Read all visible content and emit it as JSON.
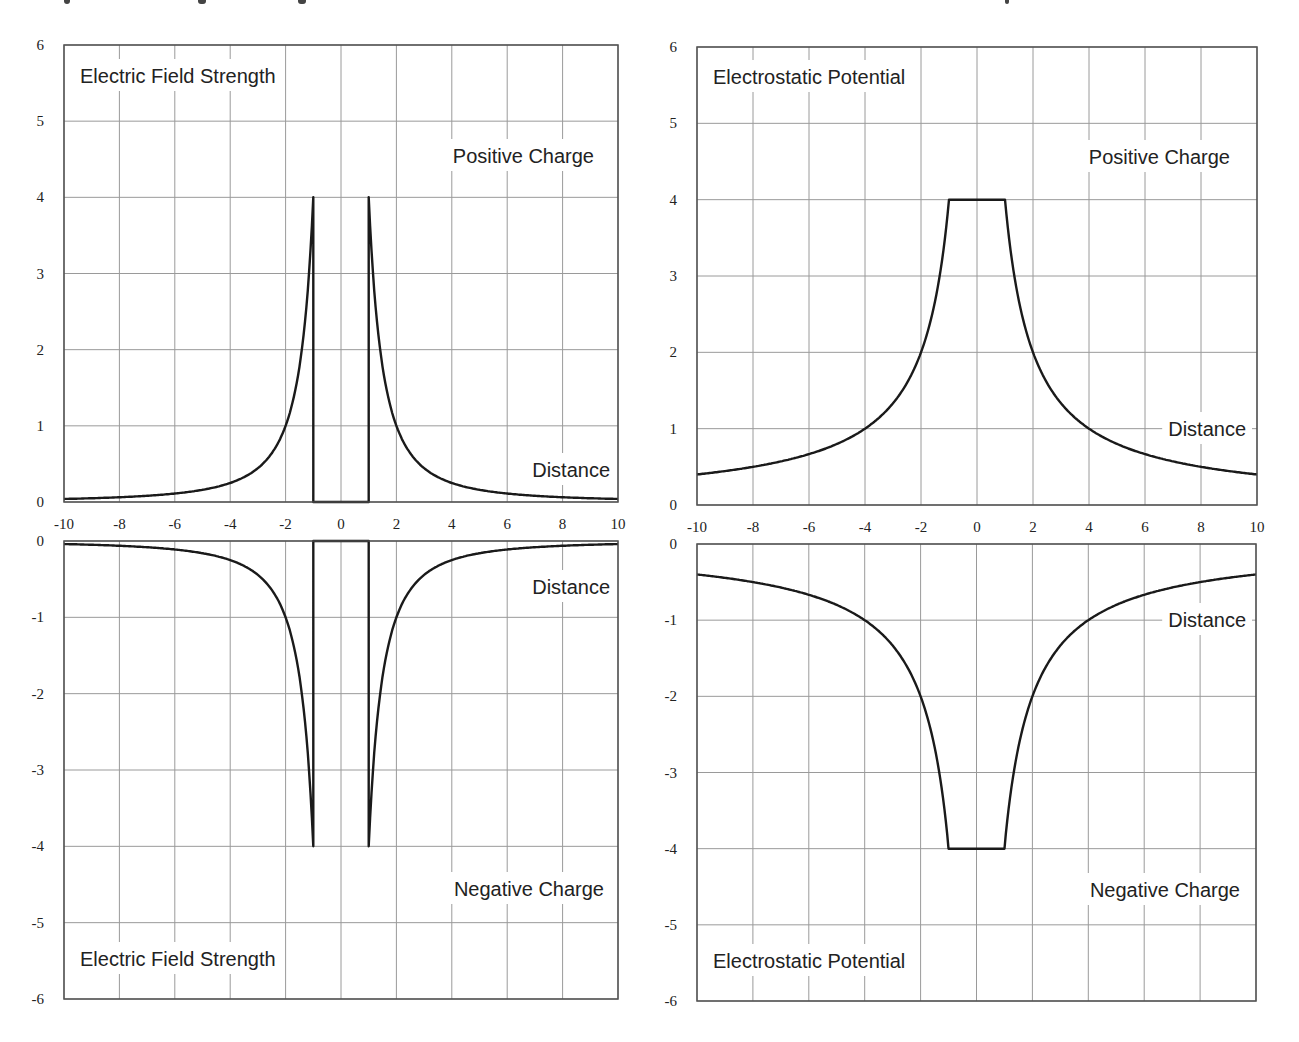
{
  "figure": {
    "width": 1299,
    "height": 1042,
    "line_color": "#1a1a1a",
    "grid_color": "#9a9a9a",
    "background": "#ffffff"
  },
  "panels": [
    {
      "id": "field-positive",
      "box": {
        "left": 64,
        "top": 45,
        "right": 618,
        "bottom": 502
      },
      "ylim": [
        0,
        6
      ],
      "xlim": [
        -10,
        10
      ],
      "yticks": [
        "0",
        "1",
        "2",
        "3",
        "4",
        "5",
        "6"
      ],
      "ytick_values": [
        0,
        1,
        2,
        3,
        4,
        5,
        6
      ],
      "xticks": [
        "-10",
        "-8",
        "-6",
        "-4",
        "-2",
        "0",
        "2",
        "4",
        "6",
        "8",
        "10"
      ],
      "show_xticks": true,
      "labels": [
        {
          "text": "Electric Field Strength",
          "x": 80,
          "y": 83,
          "anchor": "start"
        },
        {
          "text": "Positive Charge",
          "x": 594,
          "y": 163,
          "anchor": "end"
        },
        {
          "text": "Distance",
          "x": 610,
          "y": 477,
          "anchor": "end"
        }
      ]
    },
    {
      "id": "potential-positive",
      "box": {
        "left": 697,
        "top": 47,
        "right": 1257,
        "bottom": 505
      },
      "ylim": [
        0,
        6
      ],
      "xlim": [
        -10,
        10
      ],
      "yticks": [
        "0",
        "1",
        "2",
        "3",
        "4",
        "5",
        "6"
      ],
      "ytick_values": [
        0,
        1,
        2,
        3,
        4,
        5,
        6
      ],
      "xticks": [
        "-10",
        "-8",
        "-6",
        "-4",
        "-2",
        "0",
        "2",
        "4",
        "6",
        "8",
        "10"
      ],
      "show_xticks": true,
      "labels": [
        {
          "text": "Electrostatic Potential",
          "x": 713,
          "y": 84,
          "anchor": "start"
        },
        {
          "text": "Positive Charge",
          "x": 1230,
          "y": 164,
          "anchor": "end"
        },
        {
          "text": "Distance",
          "x": 1246,
          "y": 436,
          "anchor": "end"
        }
      ]
    },
    {
      "id": "field-negative",
      "box": {
        "left": 64,
        "top": 541,
        "right": 618,
        "bottom": 999
      },
      "ylim": [
        -6,
        0
      ],
      "xlim": [
        -10,
        10
      ],
      "yticks": [
        "0",
        "-1",
        "-2",
        "-3",
        "-4",
        "-5",
        "-6"
      ],
      "ytick_values": [
        0,
        -1,
        -2,
        -3,
        -4,
        -5,
        -6
      ],
      "xticks": [],
      "show_xticks": false,
      "labels": [
        {
          "text": "Distance",
          "x": 610,
          "y": 594,
          "anchor": "end"
        },
        {
          "text": "Negative Charge",
          "x": 604,
          "y": 896,
          "anchor": "end"
        },
        {
          "text": "Electric Field Strength",
          "x": 80,
          "y": 966,
          "anchor": "start"
        }
      ]
    },
    {
      "id": "potential-negative",
      "box": {
        "left": 697,
        "top": 544,
        "right": 1256,
        "bottom": 1001
      },
      "ylim": [
        -6,
        0
      ],
      "xlim": [
        -10,
        10
      ],
      "yticks": [
        "0",
        "-1",
        "-2",
        "-3",
        "-4",
        "-5",
        "-6"
      ],
      "ytick_values": [
        0,
        -1,
        -2,
        -3,
        -4,
        -5,
        -6
      ],
      "xticks": [],
      "show_xticks": false,
      "labels": [
        {
          "text": "Distance",
          "x": 1246,
          "y": 627,
          "anchor": "end"
        },
        {
          "text": "Negative Charge",
          "x": 1240,
          "y": 897,
          "anchor": "end"
        },
        {
          "text": "Electrostatic Potential",
          "x": 713,
          "y": 968,
          "anchor": "start"
        }
      ]
    }
  ],
  "chart_data": [
    {
      "type": "line",
      "title": "Electric Field Strength",
      "subtitle": "Positive Charge",
      "xlabel": "Distance",
      "ylabel": "",
      "xlim": [
        -10,
        10
      ],
      "ylim": [
        0,
        6
      ],
      "grid": true,
      "legend": null,
      "x": [
        -10,
        -8,
        -6,
        -4,
        -3,
        -2,
        -1.5,
        -1,
        -1,
        1,
        1,
        1.5,
        2,
        3,
        4,
        6,
        8,
        10
      ],
      "series": [
        {
          "name": "E (positive)",
          "values": [
            0.04,
            0.06,
            0.11,
            0.25,
            0.44,
            1.0,
            1.78,
            4.0,
            0,
            0,
            4.0,
            1.78,
            1.0,
            0.44,
            0.25,
            0.11,
            0.06,
            0.04
          ]
        }
      ],
      "annotations": [
        "Electric Field Strength",
        "Positive Charge",
        "Distance"
      ]
    },
    {
      "type": "line",
      "title": "Electrostatic Potential",
      "subtitle": "Positive Charge",
      "xlabel": "Distance",
      "ylabel": "",
      "xlim": [
        -10,
        10
      ],
      "ylim": [
        0,
        6
      ],
      "grid": true,
      "legend": null,
      "x": [
        -10,
        -8,
        -6,
        -4,
        -3,
        -2,
        -1.5,
        -1,
        1,
        1.5,
        2,
        3,
        4,
        6,
        8,
        10
      ],
      "series": [
        {
          "name": "V (positive)",
          "values": [
            0.4,
            0.5,
            0.67,
            1.0,
            1.33,
            2.0,
            2.67,
            4.0,
            4.0,
            2.67,
            2.0,
            1.33,
            1.0,
            0.67,
            0.5,
            0.4
          ]
        }
      ],
      "annotations": [
        "Electrostatic Potential",
        "Positive Charge",
        "Distance"
      ]
    },
    {
      "type": "line",
      "title": "Electric Field Strength",
      "subtitle": "Negative Charge",
      "xlabel": "Distance",
      "ylabel": "",
      "xlim": [
        -10,
        10
      ],
      "ylim": [
        -6,
        0
      ],
      "grid": true,
      "legend": null,
      "x": [
        -10,
        -8,
        -6,
        -4,
        -3,
        -2,
        -1.5,
        -1,
        -1,
        1,
        1,
        1.5,
        2,
        3,
        4,
        6,
        8,
        10
      ],
      "series": [
        {
          "name": "E (negative)",
          "values": [
            -0.04,
            -0.06,
            -0.11,
            -0.25,
            -0.44,
            -1.0,
            -1.78,
            -4.0,
            0,
            0,
            -4.0,
            -1.78,
            -1.0,
            -0.44,
            -0.25,
            -0.11,
            -0.06,
            -0.04
          ]
        }
      ],
      "annotations": [
        "Distance",
        "Negative Charge",
        "Electric Field Strength"
      ]
    },
    {
      "type": "line",
      "title": "Electrostatic Potential",
      "subtitle": "Negative Charge",
      "xlabel": "Distance",
      "ylabel": "",
      "xlim": [
        -10,
        10
      ],
      "ylim": [
        -6,
        0
      ],
      "grid": true,
      "legend": null,
      "x": [
        -10,
        -8,
        -6,
        -4,
        -3,
        -2,
        -1.5,
        -1,
        1,
        1.5,
        2,
        3,
        4,
        6,
        8,
        10
      ],
      "series": [
        {
          "name": "V (negative)",
          "values": [
            -0.4,
            -0.5,
            -0.67,
            -1.0,
            -1.33,
            -2.0,
            -2.67,
            -4.0,
            -4.0,
            -2.67,
            -2.0,
            -1.33,
            -1.0,
            -0.67,
            -0.5,
            -0.4
          ]
        }
      ],
      "annotations": [
        "Distance",
        "Negative Charge",
        "Electrostatic Potential"
      ]
    }
  ]
}
